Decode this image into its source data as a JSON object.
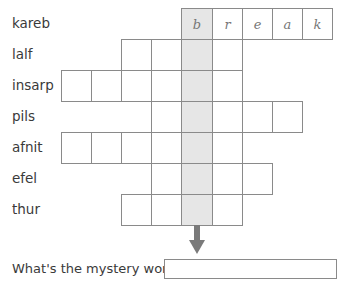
{
  "puzzle": {
    "rows": [
      {
        "clue": "kareb",
        "start_col": 4,
        "length": 5,
        "letters": [
          "b",
          "r",
          "e",
          "a",
          "k"
        ]
      },
      {
        "clue": "lalf",
        "start_col": 2,
        "length": 4,
        "letters": []
      },
      {
        "clue": "insarp",
        "start_col": 0,
        "length": 6,
        "letters": []
      },
      {
        "clue": "pils",
        "start_col": 3,
        "length": 5,
        "letters": []
      },
      {
        "clue": "afnit",
        "start_col": 0,
        "length": 6,
        "letters": []
      },
      {
        "clue": "efel",
        "start_col": 3,
        "length": 4,
        "letters": []
      },
      {
        "clue": "thur",
        "start_col": 2,
        "length": 4,
        "letters": []
      }
    ],
    "highlight_col": 4,
    "highlight_color": "#e6e6e6",
    "arrow_icon": "arrow-down-icon",
    "question": "What's the mystery word?",
    "answer_value": ""
  }
}
